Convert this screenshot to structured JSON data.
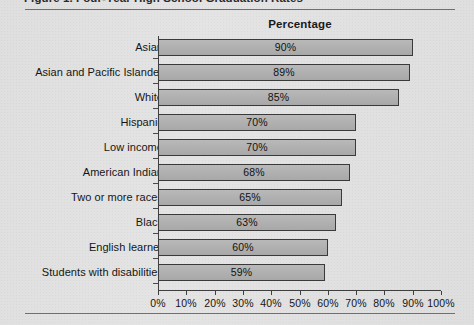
{
  "figure": {
    "caption": "Figure 1.  Four-Year High School Graduation Rates",
    "chart_title": "Percentage"
  },
  "axis": {
    "tick_labels": [
      "0%",
      "10%",
      "20%",
      "30%",
      "40%",
      "50%",
      "60%",
      "70%",
      "80%",
      "90%",
      "100%"
    ]
  },
  "chart_data": {
    "type": "bar",
    "orientation": "horizontal",
    "title": "Percentage",
    "xlabel": "",
    "ylabel": "",
    "xlim": [
      0,
      100
    ],
    "grid": false,
    "legend": null,
    "categories": [
      "Asian",
      "Asian and Pacific Islander",
      "White",
      "Hispanic",
      "Low income",
      "American Indian",
      "Two or more races",
      "Black",
      "English learner",
      "Students with disabilities"
    ],
    "values": [
      90,
      89,
      85,
      70,
      70,
      68,
      65,
      63,
      60,
      59
    ],
    "value_labels": [
      "90%",
      "89%",
      "85%",
      "70%",
      "70%",
      "68%",
      "65%",
      "63%",
      "60%",
      "59%"
    ],
    "tick_labels": [
      "0%",
      "10%",
      "20%",
      "30%",
      "40%",
      "50%",
      "60%",
      "70%",
      "80%",
      "90%",
      "100%"
    ]
  },
  "colors": {
    "bar_fill": "#b1b1b1",
    "bar_border": "#3a3a3a",
    "page_background": "#e3e3e3",
    "text": "#151515",
    "rule": "#6f6f6f"
  }
}
